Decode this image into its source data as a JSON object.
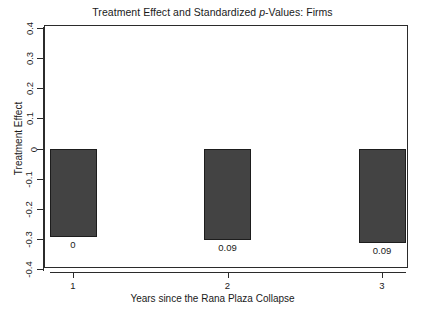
{
  "chart_data": {
    "type": "bar",
    "title": "Treatment Effect and Standardized p-Values: Firms",
    "title_parts": {
      "before_italic": "Treatment Effect and Standardized ",
      "italic": "p",
      "after_italic": "-Values: Firms"
    },
    "xlabel": "Years since the Rana Plaza Collapse",
    "ylabel": "Treatment Effect",
    "categories": [
      "1",
      "2",
      "3"
    ],
    "values": [
      -0.295,
      -0.305,
      -0.315
    ],
    "point_labels": [
      "0",
      "0.09",
      "0.09"
    ],
    "series": [
      {
        "name": "Treatment Effect",
        "values": [
          -0.295,
          -0.305,
          -0.315
        ]
      }
    ],
    "ylim": [
      -0.4,
      0.4
    ],
    "ytick_labels": [
      "0.4",
      "0.3",
      "0.2",
      "0.1",
      "0",
      "-0.1",
      "-0.2",
      "-0.3",
      "-0.4"
    ],
    "ytick_values": [
      0.4,
      0.3,
      0.2,
      0.1,
      0,
      -0.1,
      -0.2,
      -0.3,
      -0.4
    ],
    "xtick_labels": [
      "1",
      "2",
      "3"
    ],
    "grid": false,
    "legend": null,
    "annotation_note": "Numbers printed beneath each bar are standardized p-values.",
    "colors": {
      "bar_fill": "#434343",
      "bar_border": "#1d1d1d",
      "axis": "#2b2b2b",
      "text": "#1a1a1a",
      "background": "#ffffff"
    }
  }
}
